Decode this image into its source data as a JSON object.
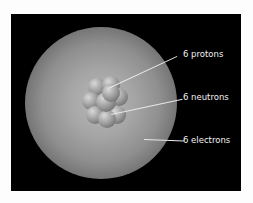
{
  "diagram": {
    "background_color": "#000000",
    "labels": [
      {
        "text": "6 protons",
        "target": "proton"
      },
      {
        "text": "6 neutrons",
        "target": "neutron"
      },
      {
        "text": "6 electrons",
        "target": "electron-cloud"
      }
    ]
  }
}
